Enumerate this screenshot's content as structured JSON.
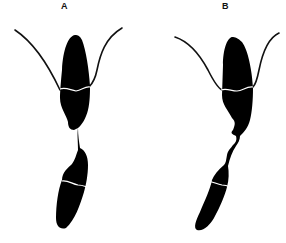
{
  "figure": {
    "panels": [
      {
        "id": "A",
        "label": "A"
      },
      {
        "id": "B",
        "label": "B"
      }
    ],
    "colors": {
      "background": "#ffffff",
      "cell_fill": "#000000",
      "division_line": "#ffffff",
      "flagellum": "#111111"
    }
  }
}
